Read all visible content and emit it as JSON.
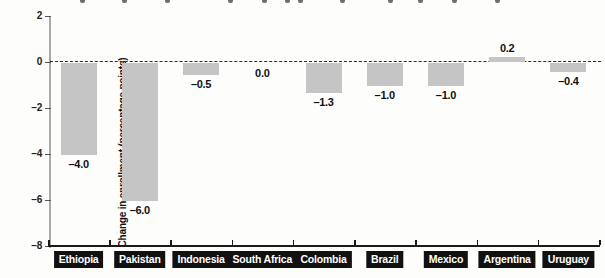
{
  "chart_data": {
    "type": "bar",
    "categories": [
      "Ethiopia",
      "Pakistan",
      "Indonesia",
      "South Africa",
      "Colombia",
      "Brazil",
      "Mexico",
      "Argentina",
      "Uruguay"
    ],
    "values": [
      -4.0,
      -6.0,
      -0.5,
      0.0,
      -1.3,
      -1.0,
      -1.0,
      0.2,
      -0.4
    ],
    "value_labels": [
      "–4.0",
      "–6.0",
      "–0.5",
      "0.0",
      "–1.3",
      "–1.0",
      "–1.0",
      "0.2",
      "–0.4"
    ],
    "title": "",
    "xlabel": "",
    "ylabel": "Change in enrollment (percentage points)",
    "ylim": [
      -8,
      2
    ],
    "yticks": [
      2,
      0,
      -2,
      -4,
      -6,
      -8
    ],
    "ytick_labels": [
      "2",
      "0",
      "–2",
      "–4",
      "–6",
      "–8"
    ],
    "zero_line": "dashed",
    "grid": "off",
    "legend": "none",
    "bar_color": "#c5c5c5",
    "axis_color": "#a9a9a9",
    "x_axis_color": "#1a1a1a",
    "category_label_text_color": "#ffffff",
    "category_label_bg_color": "#111111"
  },
  "cropped_title_fragment_xs": [
    80,
    122,
    165,
    228,
    262,
    285,
    298,
    340,
    388,
    418,
    452,
    495
  ]
}
